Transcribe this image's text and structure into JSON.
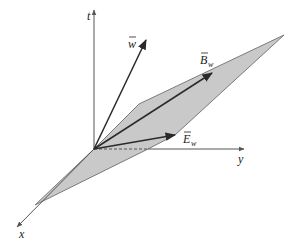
{
  "diagram": {
    "title": "",
    "colors": {
      "plane_fill": "#c9c9c9",
      "plane_stroke": "#7a7a7a",
      "axis": "#555555",
      "vector": "#2a2a2a",
      "text": "#222222",
      "background": "#ffffff"
    },
    "origin": [
      94,
      149
    ],
    "axes": [
      {
        "name": "t",
        "label": "t",
        "from": [
          94,
          149
        ],
        "to": [
          94,
          10
        ],
        "label_pos": [
          87,
          20
        ]
      },
      {
        "name": "y",
        "label": "y",
        "from": [
          148,
          149
        ],
        "to": [
          244,
          149
        ],
        "label_pos": [
          238,
          163
        ],
        "dashed_segment": {
          "from": [
            94,
            149
          ],
          "to": [
            148,
            149
          ]
        }
      },
      {
        "name": "x",
        "label": "x",
        "from": [
          94,
          149
        ],
        "to": [
          17,
          227
        ],
        "label_pos": [
          19,
          238
        ]
      }
    ],
    "plane": {
      "points": [
        [
          94,
          149
        ],
        [
          139,
          104
        ],
        [
          284,
          35
        ],
        [
          175,
          135
        ],
        [
          148,
          149
        ],
        [
          35,
          205
        ]
      ]
    },
    "vectors": [
      {
        "name": "w",
        "label": "w",
        "arrow_over": true,
        "subscript": "",
        "from": [
          94,
          149
        ],
        "to": [
          146,
          40
        ],
        "label_pos": [
          128,
          48
        ]
      },
      {
        "name": "B_w",
        "label": "B",
        "arrow_over": true,
        "subscript": "w",
        "from": [
          94,
          149
        ],
        "to": [
          212,
          73
        ],
        "label_pos": [
          200,
          64
        ]
      },
      {
        "name": "E_w",
        "label": "E",
        "arrow_over": true,
        "subscript": "w",
        "from": [
          94,
          149
        ],
        "to": [
          175,
          135
        ],
        "label_pos": [
          183,
          143
        ]
      }
    ]
  }
}
